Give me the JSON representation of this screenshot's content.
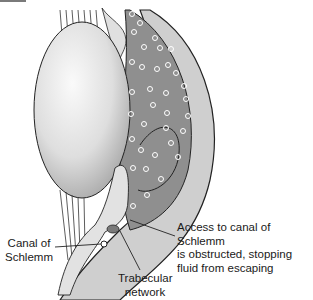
{
  "diagram": {
    "labels": {
      "canal_of_schlemm": [
        "Canal of",
        "Schlemm"
      ],
      "obstruction_note": [
        "Access to canal of Schlemm",
        "is obstructed, stopping",
        "fluid from escaping"
      ],
      "trabecular_network": [
        "Trabecular",
        "network"
      ]
    },
    "colors": {
      "lens": "#e6e6e6",
      "chamber": "#8f8f8f",
      "cornea": "#c9c9c9",
      "tissue": "#d8d8d8",
      "bubble": "#ffffff",
      "outline": "#222222"
    }
  }
}
